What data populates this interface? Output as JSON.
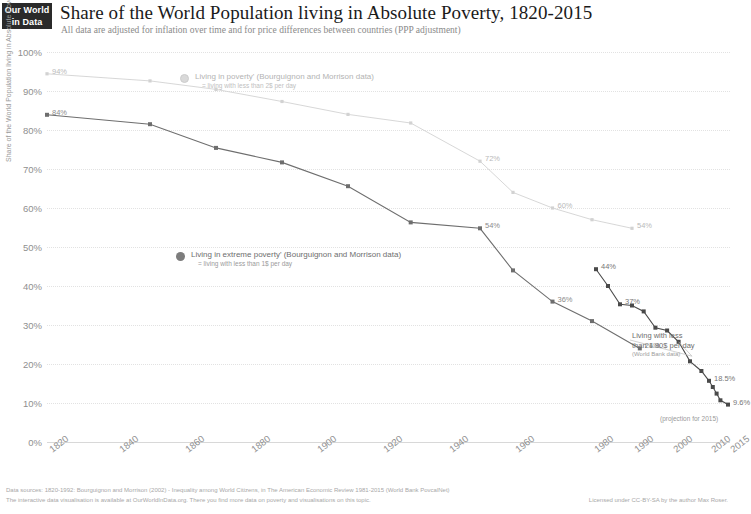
{
  "logo": {
    "line1": "Our World",
    "line2": "in Data"
  },
  "header": {
    "title": "Share of the World Population living in Absolute Poverty, 1820-2015",
    "subtitle": "All data are adjusted for inflation over time and for price differences between countries (PPP adjustment)"
  },
  "legend": {
    "poverty": {
      "label": "Living in poverty' (Bourguignon and Morrison data)",
      "sublabel": "= living with less than 2$ per day"
    },
    "extreme": {
      "label": "Living in extreme poverty' (Bourguignon and Morrison data)",
      "sublabel": "= living with less than 1$ per day"
    }
  },
  "annotation": {
    "line1": "Living with less",
    "line2": "than 1.90$ per day",
    "source": "(World Bank data)"
  },
  "projection_note": "(projection for 2015)",
  "footer": {
    "line1": "Data sources: 1820-1992: Bourguignon and Morrison (2002) - Inequality among World Citizens, in The American Economic Review 1981-2015 (World Bank PovcalNet)",
    "line2": "The interactive data visualisation is available at OurWorldInData.org. There you find more data on poverty and visualisations on this topic.",
    "licence": "Licensed under CC-BY-SA by the author Max Roser."
  },
  "colors": {
    "poverty": "#d2d2d2",
    "extreme": "#6e6e6e",
    "world_bank": "#4a4a4a",
    "grid": "#e2e2e2",
    "axis_text": "#8f8f8f"
  },
  "chart_data": {
    "type": "line",
    "title": "Share of the World Population living in Absolute Poverty, 1820-2015",
    "subtitle": "All data are adjusted for inflation over time and for price differences between countries (PPP adjustment)",
    "xlabel": "",
    "ylabel": "Share of the World Population living in Absolute Poverty",
    "xlim": [
      1820,
      2015
    ],
    "ylim": [
      0,
      100
    ],
    "grid": true,
    "legend_position": "inside",
    "yticks": [
      "0%",
      "10%",
      "20%",
      "30%",
      "40%",
      "50%",
      "60%",
      "70%",
      "80%",
      "90%",
      "100%"
    ],
    "ytick_values": [
      0,
      10,
      20,
      30,
      40,
      50,
      60,
      70,
      80,
      90,
      100
    ],
    "xticks": [
      "1820",
      "1840",
      "1860",
      "1880",
      "1900",
      "1920",
      "1940",
      "1960",
      "1980",
      "1990",
      "2000",
      "2010",
      "2015"
    ],
    "xtick_values": [
      1820,
      1840,
      1860,
      1880,
      1900,
      1920,
      1940,
      1960,
      1980,
      1990,
      2000,
      2010,
      2015
    ],
    "series": [
      {
        "name": "Living in poverty' (Bourguignon and Morrison data) = living with less than 2$ per day",
        "color": "#d2d2d2",
        "x": [
          1820,
          1850,
          1870,
          1890,
          1910,
          1929,
          1950,
          1960,
          1970,
          1980,
          1990
        ],
        "values": [
          94.4,
          92.6,
          90.4,
          87.3,
          84.0,
          81.8,
          72.0,
          64.0,
          60.0,
          57.0,
          54.8
        ],
        "labels": [
          {
            "x": 1820,
            "value": 94.4,
            "text": "94%"
          },
          {
            "x": 1950,
            "value": 72.0,
            "text": "72%"
          },
          {
            "x": 1970,
            "value": 60.0,
            "text": "60%"
          },
          {
            "x": 1990,
            "value": 54.8,
            "text": "54%"
          }
        ]
      },
      {
        "name": "Living in extreme poverty' (Bourguignon and Morrison data) = living with less than 1$ per day",
        "color": "#6e6e6e",
        "x": [
          1820,
          1850,
          1870,
          1890,
          1910,
          1929,
          1950,
          1960,
          1970,
          1980,
          1992
        ],
        "values": [
          83.9,
          81.5,
          75.4,
          71.7,
          65.6,
          56.3,
          54.8,
          44.0,
          36.0,
          31.0,
          24.0
        ],
        "labels": [
          {
            "x": 1820,
            "value": 83.9,
            "text": "84%"
          },
          {
            "x": 1950,
            "value": 54.8,
            "text": "54%"
          },
          {
            "x": 1970,
            "value": 36.0,
            "text": "36%"
          },
          {
            "x": 1992,
            "value": 24.0,
            "text": "24%"
          }
        ]
      },
      {
        "name": "Living with less than 1.90$ per day (World Bank data)",
        "color": "#4a4a4a",
        "x": [
          1981,
          1984,
          1987,
          1990,
          1993,
          1996,
          1999,
          2002,
          2005,
          2008,
          2010,
          2011,
          2012,
          2013,
          2015
        ],
        "values": [
          44.3,
          40.0,
          35.3,
          35.0,
          33.5,
          29.3,
          28.6,
          25.7,
          20.7,
          18.2,
          15.7,
          14.1,
          12.4,
          10.7,
          9.6
        ],
        "labels": [
          {
            "x": 1981,
            "value": 44.3,
            "text": "44%"
          },
          {
            "x": 1987,
            "value": 35.3,
            "text": "37%"
          },
          {
            "x": 2010,
            "value": 15.7,
            "text": "18.5%"
          },
          {
            "x": 2015,
            "value": 9.6,
            "text": "9.6%"
          }
        ]
      }
    ]
  }
}
